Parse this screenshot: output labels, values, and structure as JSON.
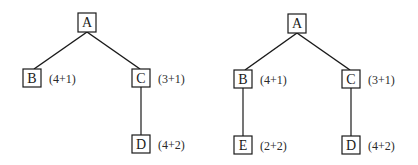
{
  "diagrams": [
    {
      "name": "tree-left",
      "nodes": [
        {
          "id": "A",
          "label": "A",
          "x": 87,
          "y": 22,
          "cost": ""
        },
        {
          "id": "B",
          "label": "B",
          "x": 32,
          "y": 78,
          "cost": "(4+1)"
        },
        {
          "id": "C",
          "label": "C",
          "x": 141,
          "y": 78,
          "cost": "(3+1)"
        },
        {
          "id": "D",
          "label": "D",
          "x": 141,
          "y": 144,
          "cost": "(4+2)"
        }
      ],
      "edges": [
        [
          "A",
          "B"
        ],
        [
          "A",
          "C"
        ],
        [
          "C",
          "D"
        ]
      ]
    },
    {
      "name": "tree-right",
      "nodes": [
        {
          "id": "A",
          "label": "A",
          "x": 297,
          "y": 23,
          "cost": ""
        },
        {
          "id": "B",
          "label": "B",
          "x": 243,
          "y": 79,
          "cost": "(4+1)"
        },
        {
          "id": "C",
          "label": "C",
          "x": 351,
          "y": 79,
          "cost": "(3+1)"
        },
        {
          "id": "E",
          "label": "E",
          "x": 243,
          "y": 145,
          "cost": "(2+2)"
        },
        {
          "id": "D",
          "label": "D",
          "x": 351,
          "y": 145,
          "cost": "(4+2)"
        }
      ],
      "edges": [
        [
          "A",
          "B"
        ],
        [
          "A",
          "C"
        ],
        [
          "B",
          "E"
        ],
        [
          "C",
          "D"
        ]
      ]
    }
  ]
}
